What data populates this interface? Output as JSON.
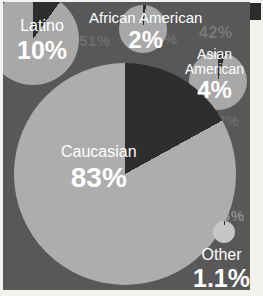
{
  "chart_data": {
    "type": "pie",
    "title": "",
    "categories": [
      "Caucasian",
      "Latino",
      "Asian American",
      "African American",
      "Other"
    ],
    "values": [
      83,
      10,
      4,
      2,
      1.1
    ],
    "value_labels": [
      "83%",
      "10%",
      "4%",
      "2%",
      "1.1%"
    ],
    "legend": "inline-labels",
    "grid": false,
    "colors": {
      "background": "#585858",
      "slice_light": "#adadad",
      "slice_dark": "#2e2e2e",
      "label_text": "#ffffff",
      "ghost_text": "#6e6e6e",
      "page_margin": "#f2f2ef",
      "edge_marker": "#2b2b2b"
    },
    "annotations": [
      "51%",
      "40%",
      "42%",
      "47%",
      "46%"
    ]
  },
  "main_pie": {
    "name": "Caucasian",
    "value": "83%"
  },
  "satellites": [
    {
      "name": "Latino",
      "value": "10%"
    },
    {
      "name": "African American",
      "value": "2%"
    },
    {
      "name": "Asian American",
      "value": "4%"
    },
    {
      "name": "Other",
      "value": "1.1%"
    }
  ],
  "asian": {
    "line1": "Asian",
    "line2": "American",
    "value": "4%"
  },
  "ghost": {
    "p51": "51%",
    "p40": "40%",
    "p42": "42%",
    "p47": "47%",
    "p46": "46%"
  }
}
